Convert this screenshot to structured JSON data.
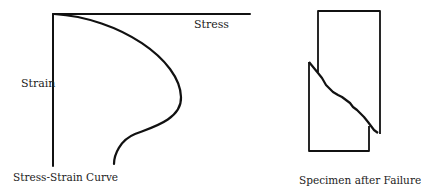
{
  "left_figure": {
    "title": "Stress-Strain Curve",
    "x_axis_label": "Stress",
    "y_axis_label": "Strain"
  },
  "right_figure": {
    "title": "Specimen after Failure"
  },
  "colors": {
    "stroke": "#111111",
    "background": "#ffffff"
  }
}
